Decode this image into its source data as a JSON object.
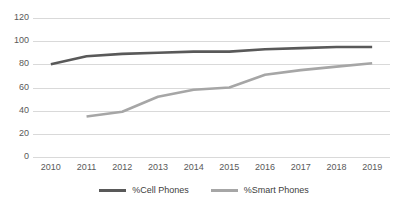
{
  "chart_data": {
    "type": "line",
    "title": "",
    "subtitle": "",
    "xlabel": "",
    "ylabel": "",
    "categories": [
      "2010",
      "2011",
      "2012",
      "2013",
      "2014",
      "2015",
      "2016",
      "2017",
      "2018",
      "2019"
    ],
    "x": [
      2010,
      2011,
      2012,
      2013,
      2014,
      2015,
      2016,
      2017,
      2018,
      2019
    ],
    "ylim": [
      0,
      120
    ],
    "ytick_labels": [
      "0",
      "20",
      "40",
      "60",
      "80",
      "100",
      "120"
    ],
    "ytick_values": [
      0,
      20,
      40,
      60,
      80,
      100,
      120
    ],
    "ytick_step": 20,
    "grid": true,
    "grid_axis": "y",
    "legend_position": "bottom",
    "series": [
      {
        "name": "%Cell Phones",
        "color": "#595959",
        "values": [
          80,
          87,
          89,
          90,
          91,
          91,
          93,
          94,
          95,
          95
        ]
      },
      {
        "name": "%Smart Phones",
        "color": "#a6a6a6",
        "values": [
          null,
          35,
          39,
          52,
          58,
          60,
          71,
          75,
          78,
          81
        ]
      }
    ]
  },
  "legend": {
    "items": [
      {
        "label": "%Cell Phones",
        "color": "#595959"
      },
      {
        "label": "%Smart Phones",
        "color": "#a6a6a6"
      }
    ]
  }
}
